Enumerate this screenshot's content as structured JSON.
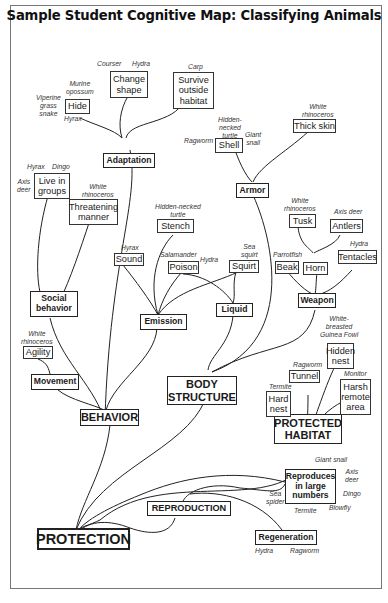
{
  "title": "Sample Student Cognitive Map: Classifying Animals",
  "nodes": {
    "protection": "PROTECTION",
    "behavior": "BEHAVIOR",
    "body_structure": "BODY\nSTRUCTURE",
    "protected_habitat": "PROTECTED\nHABITAT",
    "reproduction": "REPRODUCTION",
    "adaptation": "Adaptation",
    "social_behavior": "Social\nbehavior",
    "movement": "Movement",
    "emission": "Emission",
    "liquid": "Liquid",
    "armor": "Armor",
    "weapon": "Weapon",
    "reproduces_large": "Reproduces\nin large\nnumbers",
    "regeneration": "Regeneration",
    "hide": "Hide",
    "change_shape": "Change\nshape",
    "survive_outside": "Survive\noutside\nhabitat",
    "live_in_groups": "Live in\ngroups",
    "threatening_manner": "Threatening\nmanner",
    "agility": "Agility",
    "stench": "Stench",
    "sound": "Sound",
    "poison": "Poison",
    "squirt": "Squirt",
    "shell": "Shell",
    "thick_skin": "Thick skin",
    "tusk": "Tusk",
    "antlers": "Antlers",
    "horn": "Horn",
    "beak": "Beak",
    "tentacles": "Tentacles",
    "hidden_nest": "Hidden\nnest",
    "tunnel": "Tunnel",
    "hard_nest": "Hard\nnest",
    "harsh_remote": "Harsh\nremote\narea"
  },
  "examples": {
    "viperine": "Viperine\ngrass\nsnake",
    "murine": "Murine\nopossum",
    "hyrax_hide": "Hyrax",
    "courser": "Courser",
    "hydra_change": "Hydra",
    "carp": "Carp",
    "hyrax_groups": "Hyrax",
    "dingo_groups": "Dingo",
    "axis_deer_groups": "Axis\ndeer",
    "white_rhino_threat": "White\nrhinoceros",
    "white_rhino_agility": "White\nrhinoceros",
    "hidden_turtle_stench": "Hidden-necked\nturtle",
    "hyrax_sound": "Hyrax",
    "salamander": "Salamander",
    "hydra_poison": "Hydra",
    "sea_squirt": "Sea\nsquirt",
    "hidden_turtle_shell": "Hidden-\nnecked\nturtle",
    "ragworm_shell": "Ragworm",
    "giant_snail_shell": "Giant\nsnail",
    "white_rhino_skin": "White\nrhinoceros",
    "white_rhino_tusk": "White\nrhinoceros",
    "axis_deer_antlers": "Axis deer",
    "parrotfish": "Parrotfish",
    "hydra_tentacles": "Hydra",
    "guinea_fowl": "White-\nbreasted\nGuinea Fowl",
    "ragworm_tunnel": "Ragworm",
    "monitor": "Monitor",
    "termite_nest": "Termite",
    "giant_snail_repro": "Giant  snail",
    "axis_deer_repro": "Axis\ndeer",
    "dingo_repro": "Dingo",
    "sea_spider": "Sea\nspider",
    "termite_repro": "Termite",
    "blowfly": "Blowfly",
    "hydra_regen": "Hydra",
    "ragworm_regen": "Ragworm"
  }
}
